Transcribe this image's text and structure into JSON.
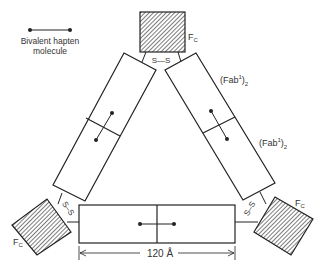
{
  "legend": {
    "line1": "Bivalent hapten",
    "line2": "molecule"
  },
  "labels": {
    "fc_top": "F",
    "fc_top_sub": "C",
    "fc_left": "F",
    "fc_left_sub": "C",
    "fc_right": "F",
    "fc_right_sub": "C",
    "fab_upper": "(Fab",
    "fab_upper_sup": "1",
    "fab_upper_close": ")",
    "fab_upper_sub": "2",
    "fab_lower": "(Fab",
    "fab_lower_sup": "1",
    "fab_lower_close": ")",
    "fab_lower_sub": "2",
    "ss_top": "S—S",
    "ss_left": "S–S",
    "ss_right": "S–S",
    "dimension": "120 Å"
  },
  "colors": {
    "stroke": "#222222",
    "text": "#333333",
    "background": "#ffffff"
  }
}
